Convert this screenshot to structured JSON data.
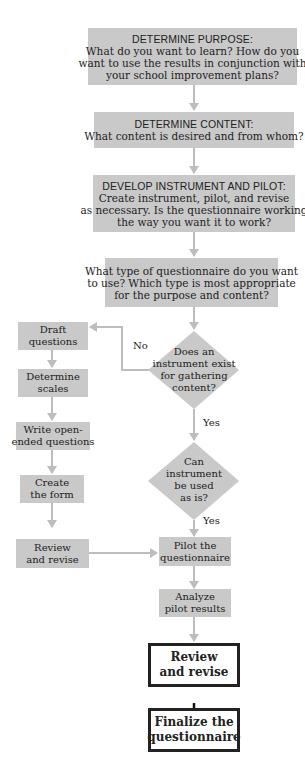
{
  "diagram": {
    "type": "flowchart",
    "colors": {
      "box_fill": "#c9c9c9",
      "arrow_gray": "#bdbdbd",
      "final_border": "#222222",
      "final_fill": "#ffffff"
    },
    "main_steps": [
      {
        "id": "purpose",
        "heading": "DETERMINE PURPOSE:",
        "lines": [
          "What do you want to learn? How do you",
          "want to use the results in conjunction with",
          "your school improvement plans?"
        ]
      },
      {
        "id": "content",
        "heading": "DETERMINE CONTENT:",
        "lines": [
          "What content is desired and from whom?"
        ]
      },
      {
        "id": "develop",
        "heading": "DEVELOP INSTRUMENT AND PILOT:",
        "lines": [
          "Create instrument, pilot, and revise",
          "as necessary. Is the questionnaire working",
          "the way you want it to work?"
        ]
      },
      {
        "id": "type",
        "lines": [
          "What type of questionnaire do you want",
          "to use? Which type is most appropriate",
          "for the purpose and content?"
        ]
      }
    ],
    "decisions": [
      {
        "id": "exist",
        "lines": [
          "Does an",
          "instrument exist",
          "for gathering",
          "content?"
        ],
        "yes": "Yes",
        "no": "No"
      },
      {
        "id": "asis",
        "lines": [
          "Can",
          "instrument",
          "be used",
          "as is?"
        ],
        "yes": "Yes"
      }
    ],
    "left_steps": [
      {
        "id": "draft",
        "lines": [
          "Draft",
          "questions"
        ]
      },
      {
        "id": "scales",
        "lines": [
          "Determine",
          "scales"
        ]
      },
      {
        "id": "open",
        "lines": [
          "Write open-",
          "ended questions"
        ]
      },
      {
        "id": "form",
        "lines": [
          "Create",
          "the form"
        ]
      },
      {
        "id": "review_left",
        "lines": [
          "Review",
          "and revise"
        ]
      }
    ],
    "right_steps": [
      {
        "id": "pilot",
        "lines": [
          "Pilot the",
          "questionnaire"
        ]
      },
      {
        "id": "analyze",
        "lines": [
          "Analyze",
          "pilot results"
        ]
      }
    ],
    "final_steps": [
      {
        "id": "review_final",
        "lines": [
          "Review",
          "and revise"
        ]
      },
      {
        "id": "finalize",
        "lines": [
          "Finalize the",
          "questionnaire"
        ]
      }
    ]
  }
}
